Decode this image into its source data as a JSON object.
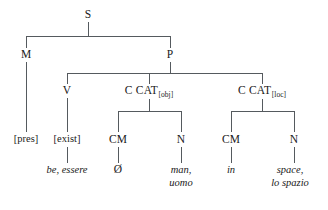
{
  "diagram": {
    "type": "syntactic-tree",
    "title": "",
    "line_color": "#555a5e",
    "text_color": "#1a1a1a",
    "background": "#ffffff",
    "nodes": {
      "root": "S",
      "mood": "M",
      "predicate": "P",
      "verb": "V",
      "ccat_obj_base": "C CAT",
      "ccat_obj_sub": "[obj]",
      "ccat_loc_base": "C CAT",
      "ccat_loc_sub": "[loc]",
      "cm_obj": "CM",
      "n_obj": "N",
      "cm_loc": "CM",
      "n_loc": "N",
      "pres": "[pres]",
      "exist": "[exist]"
    },
    "leaves": {
      "verb_forms": "be, essere",
      "cm_obj_form": "Ø",
      "n_obj_line1": "man,",
      "n_obj_line2": "uomo",
      "cm_loc_form": "in",
      "n_loc_line1": "space,",
      "n_loc_line2": "lo spazio"
    }
  }
}
